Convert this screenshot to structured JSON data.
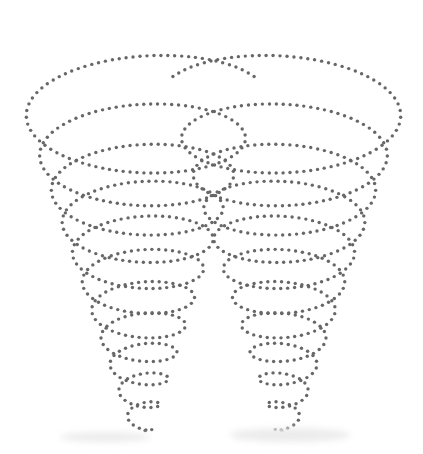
{
  "image": {
    "title": "Double conical dotted spiral",
    "width": 423,
    "height": 454,
    "background": "#ffffff",
    "dot_color": "#676767",
    "dot_radius": 1.7,
    "dot_spacing": 6.8
  },
  "spirals": [
    {
      "name": "left-spiral",
      "direction": 1,
      "start_angle_deg": 18,
      "turns": 11.2,
      "top": {
        "cx": 139,
        "cy": 92,
        "rx": 121,
        "ry": 50
      },
      "bottom": {
        "cx": 142,
        "cy": 436,
        "rx": 8,
        "ry": 4
      },
      "taper_power": 0.82
    },
    {
      "name": "right-spiral",
      "direction": -1,
      "start_angle_deg": 162,
      "turns": 11.2,
      "top": {
        "cx": 288,
        "cy": 92,
        "rx": 121,
        "ry": 50
      },
      "bottom": {
        "cx": 285,
        "cy": 436,
        "rx": 8,
        "ry": 4
      },
      "taper_power": 0.82
    }
  ],
  "smudges": [
    {
      "x": 60,
      "y": 432,
      "w": 90,
      "h": 10
    },
    {
      "x": 230,
      "y": 428,
      "w": 120,
      "h": 14
    }
  ]
}
